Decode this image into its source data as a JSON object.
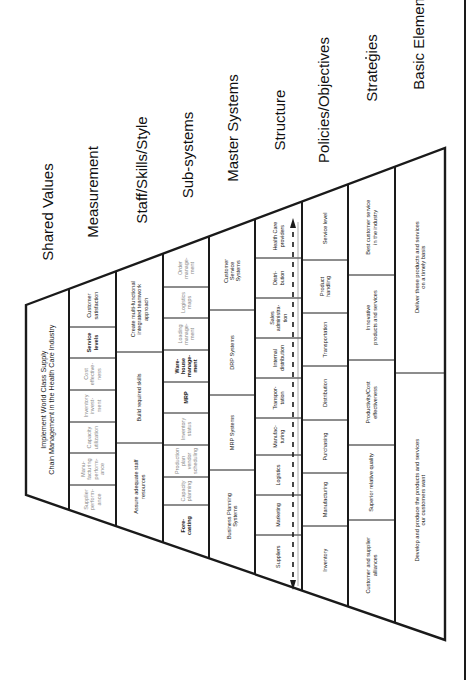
{
  "document": {
    "orientation": "rotated-90-ccw",
    "colors": {
      "ink": "#1a1a1a",
      "faint_text": "#8a8a8a",
      "background": "#ffffff"
    }
  },
  "layers": [
    {
      "title": "Shared Values",
      "cells": [
        {
          "text": [
            "Implement World Class Supply",
            "Chain Management in the Health Care Industry"
          ],
          "style": "normal"
        }
      ]
    },
    {
      "title": "Measurement",
      "cells": [
        {
          "text": [
            "Customer",
            "satisfaction"
          ],
          "style": "normal"
        },
        {
          "text": [
            "Service",
            "levels"
          ],
          "style": "bold"
        },
        {
          "text": [
            "Cost",
            "effective-",
            "ness"
          ],
          "style": "faint"
        },
        {
          "text": [
            "Inventory",
            "invest-",
            "ment"
          ],
          "style": "faint"
        },
        {
          "text": [
            "Capacity",
            "utilization"
          ],
          "style": "faint"
        },
        {
          "text": [
            "Manu-",
            "facturing",
            "perform-",
            "ance"
          ],
          "style": "faint"
        },
        {
          "text": [
            "Supplier",
            "perform-",
            "ance"
          ],
          "style": "faint"
        }
      ]
    },
    {
      "title": "Staff/Skills/Style",
      "cells": [
        {
          "text": [
            "Create multi-functional",
            "integrated teamwork",
            "approach"
          ],
          "style": "normal"
        },
        {
          "text": [
            "Build required skills"
          ],
          "style": "normal"
        },
        {
          "text": [
            "Assure adequate staff",
            "resources"
          ],
          "style": "normal"
        }
      ]
    },
    {
      "title": "Sub-systems",
      "cells": [
        {
          "text": [
            "Order",
            "manage-",
            "ment"
          ],
          "style": "faint"
        },
        {
          "text": [
            "Logistics",
            "maps"
          ],
          "style": "faint"
        },
        {
          "text": [
            "Loading",
            "manage-",
            "ment"
          ],
          "style": "faint"
        },
        {
          "text": [
            "Ware-",
            "house",
            "manage-",
            "ment"
          ],
          "style": "bold"
        },
        {
          "text": [
            "MRP"
          ],
          "style": "bold"
        },
        {
          "text": [
            "Inventory",
            "status"
          ],
          "style": "faint"
        },
        {
          "text": [
            "Production",
            "plan",
            "vendor",
            "scheduling"
          ],
          "style": "faint"
        },
        {
          "text": [
            "Capacity",
            "planning"
          ],
          "style": "faint"
        },
        {
          "text": [
            "Fore-",
            "casting"
          ],
          "style": "bold"
        }
      ]
    },
    {
      "title": "Master Systems",
      "cells": [
        {
          "text": [
            "Customer",
            "Service",
            "Systems"
          ],
          "style": "normal"
        },
        {
          "text": [
            "DRP Systems"
          ],
          "style": "normal"
        },
        {
          "text": [
            "MRP Systems"
          ],
          "style": "normal"
        },
        {
          "text": [
            "Business Planning",
            "Systems"
          ],
          "style": "normal"
        }
      ]
    },
    {
      "title": "Structure",
      "cells": [
        {
          "text": [
            "Health Care",
            "providers"
          ],
          "style": "normal"
        },
        {
          "text": [
            "Distri-",
            "bution"
          ],
          "style": "normal"
        },
        {
          "text": [
            "Sales",
            "administra-",
            "tion"
          ],
          "style": "normal"
        },
        {
          "text": [
            "Internal",
            "distribution"
          ],
          "style": "normal"
        },
        {
          "text": [
            "Transpor-",
            "tation"
          ],
          "style": "normal"
        },
        {
          "text": [
            "Manufac-",
            "turing"
          ],
          "style": "normal"
        },
        {
          "text": [
            "Logistics"
          ],
          "style": "normal"
        },
        {
          "text": [
            "Marketing"
          ],
          "style": "normal"
        },
        {
          "text": [
            "Suppliers"
          ],
          "style": "normal"
        }
      ]
    },
    {
      "title": "Policies/Objectives",
      "cells": [
        {
          "text": [
            "Service level"
          ],
          "style": "normal"
        },
        {
          "text": [
            "Product",
            "handling"
          ],
          "style": "normal"
        },
        {
          "text": [
            "Transportation"
          ],
          "style": "normal"
        },
        {
          "text": [
            "Distribution"
          ],
          "style": "normal"
        },
        {
          "text": [
            "Purchasing"
          ],
          "style": "normal"
        },
        {
          "text": [
            "Manufacturing"
          ],
          "style": "normal"
        },
        {
          "text": [
            "Inventory"
          ],
          "style": "normal"
        }
      ]
    },
    {
      "title": "Strategies",
      "cells": [
        {
          "text": [
            "Best customer service",
            "in the industry"
          ],
          "style": "normal"
        },
        {
          "text": [
            "Innovative",
            "products and services"
          ],
          "style": "normal"
        },
        {
          "text": [
            "Productivity/Cost",
            "effectiveness"
          ],
          "style": "normal"
        },
        {
          "text": [
            "Superior relative quality"
          ],
          "style": "normal"
        },
        {
          "text": [
            "Customer and supplier",
            "alliances"
          ],
          "style": "normal"
        }
      ]
    },
    {
      "title": "Basic Elements",
      "cells": [
        {
          "text": [
            "Deliver these products and services",
            "on a timely basis"
          ],
          "style": "normal"
        },
        {
          "text": [
            "Develop and produce the products and services",
            "our customers want"
          ],
          "style": "normal"
        }
      ]
    }
  ]
}
